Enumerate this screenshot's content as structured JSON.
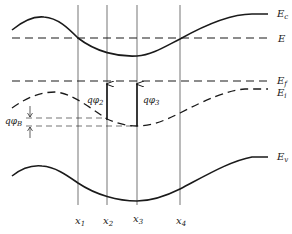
{
  "diagram": {
    "colors": {
      "ink": "#1a1a1a",
      "background": "#ffffff"
    },
    "bands": {
      "Ec": {
        "label": "E",
        "sub": "c"
      },
      "E": {
        "label": "E"
      },
      "Ef": {
        "label": "E",
        "sub": "f"
      },
      "Ei": {
        "label": "E",
        "sub": "i"
      },
      "Ev": {
        "label": "E",
        "sub": "v"
      }
    },
    "annotations": {
      "phi2": {
        "prefix": "qφ",
        "sub": "2"
      },
      "phi3": {
        "prefix": "qφ",
        "sub": "3"
      },
      "phiB": {
        "prefix": "qφ",
        "sub": "B"
      }
    },
    "positions": [
      {
        "label": "x",
        "sub": "1"
      },
      {
        "label": "x",
        "sub": "2"
      },
      {
        "label": "x",
        "sub": "3"
      },
      {
        "label": "x",
        "sub": "4"
      }
    ]
  }
}
